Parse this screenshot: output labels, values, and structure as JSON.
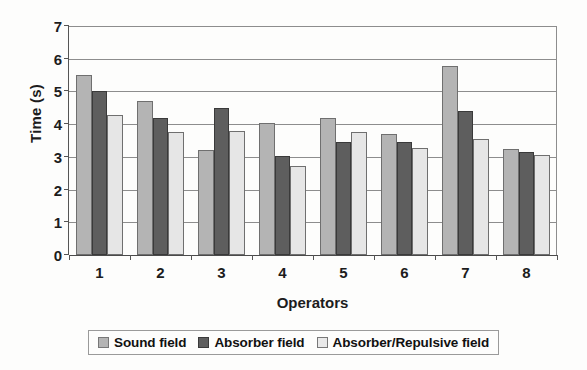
{
  "chart_data": {
    "type": "bar",
    "title": "",
    "xlabel": "Operators",
    "ylabel": "Time (s)",
    "categories": [
      "1",
      "2",
      "3",
      "4",
      "5",
      "6",
      "7",
      "8"
    ],
    "ylim": [
      0,
      7
    ],
    "yticks": [
      0,
      1,
      2,
      3,
      4,
      5,
      6,
      7
    ],
    "ytick_labels": [
      "0",
      "1",
      "2",
      "3",
      "4",
      "5",
      "6",
      "7"
    ],
    "grid": true,
    "legend_position": "bottom",
    "series": [
      {
        "name": "Sound field",
        "color": "#b4b4b4",
        "values": [
          5.5,
          4.7,
          3.22,
          4.05,
          4.2,
          3.7,
          5.78,
          3.23
        ]
      },
      {
        "name": "Absorber field",
        "color": "#5e5e5e",
        "values": [
          5.02,
          4.18,
          4.5,
          3.02,
          3.45,
          3.45,
          4.4,
          3.15
        ]
      },
      {
        "name": "Absorber/Repulsive field",
        "color": "#e6e6e6",
        "values": [
          4.28,
          3.77,
          3.78,
          2.73,
          3.75,
          3.27,
          3.55,
          3.05
        ]
      }
    ]
  }
}
